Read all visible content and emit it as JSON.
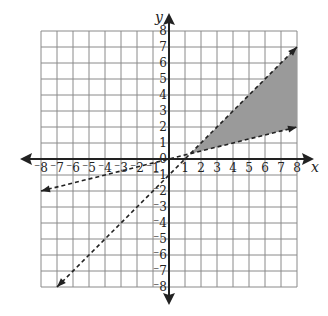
{
  "chart_data": {
    "type": "line",
    "title": "",
    "xlabel": "x",
    "ylabel": "y",
    "xlim": [
      -8,
      8
    ],
    "ylim": [
      -8,
      8
    ],
    "grid": true,
    "x_ticks": [
      "-8",
      "-7",
      "-6",
      "-5",
      "-4",
      "-3",
      "-2",
      "-1",
      "1",
      "2",
      "3",
      "4",
      "5",
      "6",
      "7",
      "8"
    ],
    "y_ticks": [
      "8",
      "7",
      "6",
      "5",
      "4",
      "3",
      "2",
      "1",
      "0",
      "-1",
      "-2",
      "-3",
      "-4",
      "-5",
      "-6",
      "-7",
      "-8"
    ],
    "series": [
      {
        "name": "y = x - 1",
        "style": "dashed",
        "points": [
          [
            -7,
            -8
          ],
          [
            1,
            0
          ],
          [
            8,
            7
          ]
        ]
      },
      {
        "name": "y = x / 4",
        "style": "dashed",
        "points": [
          [
            -8,
            -2
          ],
          [
            0,
            0
          ],
          [
            8,
            2
          ]
        ]
      }
    ],
    "shaded_region": {
      "description": "between y = x - 1 (above) and y = x/4 (below), for x > 4/3",
      "vertices": [
        [
          1.333,
          0.333
        ],
        [
          8,
          7
        ],
        [
          8,
          2
        ]
      ],
      "color": "#9a9a9a"
    },
    "colors": {
      "grid": "#8a8a8a",
      "axis": "#222222",
      "shade": "#9a9a9a"
    }
  }
}
